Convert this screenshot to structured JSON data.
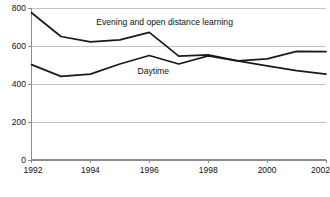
{
  "chart_data": {
    "type": "line",
    "title": "",
    "subtitle": "",
    "xlabel": "",
    "ylabel": "",
    "x": [
      1992,
      1993,
      1994,
      1995,
      1996,
      1997,
      1998,
      1999,
      2000,
      2001,
      2002
    ],
    "xtick_labels": [
      "1992",
      "1994",
      "1996",
      "1998",
      "2000",
      "2002"
    ],
    "xticks": [
      1992,
      1994,
      1996,
      1998,
      2000,
      2002
    ],
    "xlim": [
      1992,
      2002
    ],
    "ytick_labels": [
      "0",
      "200",
      "400",
      "600",
      "800"
    ],
    "yticks": [
      0,
      200,
      400,
      600,
      800
    ],
    "ylim": [
      0,
      800
    ],
    "grid": true,
    "grid_axis": "y",
    "legend_position": "inline-annotation",
    "series": [
      {
        "name": "Evening and open distance learning",
        "label_text": "Evening and open distance learning",
        "color": "#1a1a1a",
        "values": [
          775,
          650,
          622,
          632,
          672,
          547,
          553,
          522,
          532,
          572,
          570
        ]
      },
      {
        "name": "Daytime",
        "label_text": "Daytime",
        "color": "#1a1a1a",
        "values": [
          502,
          440,
          452,
          505,
          550,
          505,
          548,
          522,
          495,
          470,
          452
        ]
      }
    ],
    "annotations": [
      {
        "text": "Evening and open distance learning",
        "x": 1994.2,
        "y": 712
      },
      {
        "text": "Daytime",
        "x": 1995.6,
        "y": 452
      }
    ],
    "colors": {
      "line": "#1a1a1a",
      "grid": "#b4b4b4",
      "axis": "#8c8c8c",
      "text": "#111111",
      "background": "#ffffff"
    }
  }
}
